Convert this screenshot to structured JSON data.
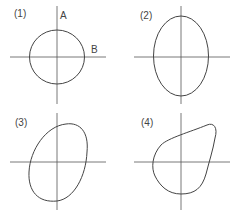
{
  "figure": {
    "type": "lissajous-patterns",
    "panels": [
      {
        "label": "(1)",
        "shape": "circle",
        "axis_labels": {
          "vertical": "A",
          "horizontal": "B"
        }
      },
      {
        "label": "(2)",
        "shape": "vertical-ellipse"
      },
      {
        "label": "(3)",
        "shape": "tilted-ellipse"
      },
      {
        "label": "(4)",
        "shape": "distorted-closed-curve"
      }
    ]
  },
  "colors": {
    "line": "#444444",
    "axis": "#555555",
    "background": "#ffffff"
  }
}
